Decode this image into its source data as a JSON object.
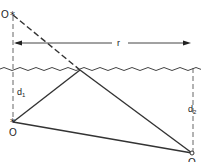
{
  "diagram": {
    "labels": {
      "source_top": "O",
      "range": "r",
      "depth_1": "d",
      "depth_1_sub": "1",
      "source_bottom": "O",
      "depth_2": "d",
      "depth_2_sub": "2",
      "receiver": "O"
    },
    "colors": {
      "line": "#333333",
      "dashed": "#666666",
      "water": "#444444",
      "background": "#ffffff"
    }
  }
}
